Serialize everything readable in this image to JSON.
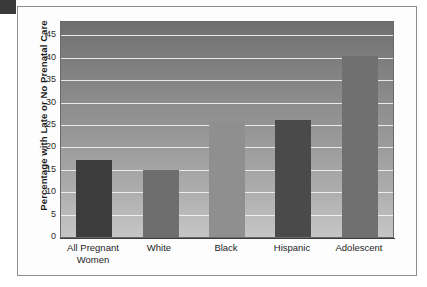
{
  "chart_data": {
    "type": "bar",
    "title": "",
    "subtitle": "",
    "xlabel": "",
    "ylabel": "Percentage with Late or No Prenatal Care",
    "categories": [
      "All Pregnant Women",
      "White",
      "Black",
      "Hispanic",
      "Adolescent"
    ],
    "category_lines": [
      [
        "All Pregnant",
        "Women"
      ],
      [
        "White"
      ],
      [
        "Black"
      ],
      [
        "Hispanic"
      ],
      [
        "Adolescent"
      ]
    ],
    "values": [
      17.2,
      14.9,
      25.9,
      26.2,
      40.3
    ],
    "ylim": [
      0,
      48
    ],
    "yticks": [
      0,
      5,
      10,
      15,
      20,
      25,
      30,
      35,
      40,
      45
    ],
    "ytick_labels": [
      "0",
      "5",
      "10",
      "15",
      "20",
      "25",
      "30",
      "35",
      "40",
      "45"
    ],
    "grid": true,
    "gridline_color": "#f2f2f2",
    "legend": false,
    "legend_position": "none",
    "bar_colors": [
      "#3c3c3c",
      "#6e6e6e",
      "#8f8f8f",
      "#4a4a4a",
      "#707070"
    ],
    "plot_background_top_color": "#6f6f6f",
    "plot_background_bottom_color": "#c6c6c6",
    "axis_color": "#3c3c3c",
    "text_color": "#1b1b1b",
    "figure_background": "#fdfdfd",
    "frame_border_color": "#8d8d8d"
  }
}
